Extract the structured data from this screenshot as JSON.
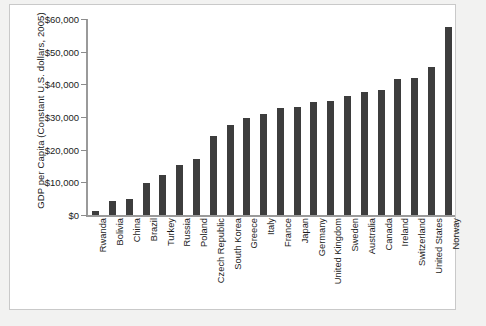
{
  "chart_data": {
    "type": "bar",
    "title": "",
    "xlabel": "",
    "ylabel": "GDP per Capita (Constant U.S. dollars, 2005)",
    "ylim": [
      0,
      60000
    ],
    "yticks": [
      0,
      10000,
      20000,
      30000,
      40000,
      50000,
      60000
    ],
    "ytick_labels": [
      "$0",
      "$10,000",
      "$20,000",
      "$30,000",
      "$40,000",
      "$50,000",
      "$60,000"
    ],
    "grid": false,
    "legend": null,
    "bar_color": "#3d3d3d",
    "categories": [
      "Rwanda",
      "Bolivia",
      "China",
      "Brazil",
      "Turkey",
      "Russia",
      "Poland",
      "Czech Republic",
      "South Korea",
      "Greece",
      "Italy",
      "France",
      "Japan",
      "Germany",
      "United Kingdom",
      "Sweden",
      "Australia",
      "Canada",
      "Ireland",
      "Switzerland",
      "United States",
      "Norway"
    ],
    "values": [
      1200,
      4300,
      5000,
      9800,
      12400,
      15300,
      17000,
      24300,
      27500,
      29600,
      31000,
      32800,
      33200,
      34700,
      35000,
      36300,
      37700,
      38400,
      41500,
      41800,
      45300,
      57500
    ]
  }
}
